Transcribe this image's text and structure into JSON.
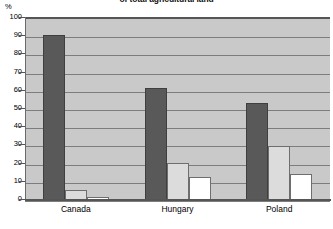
{
  "chart_data": {
    "type": "bar",
    "title": "of total agricultural land",
    "subtitle": "",
    "xlabel": "",
    "ylabel": "%",
    "ylim": [
      0,
      100
    ],
    "ytick_step": 10,
    "yticks": [
      100,
      90,
      80,
      70,
      60,
      50,
      40,
      30,
      20,
      10,
      0
    ],
    "grid": true,
    "legend": "none",
    "categories": [
      "Canada",
      "Hungary",
      "Poland"
    ],
    "series": [
      {
        "name": "series-1",
        "color": "#595959",
        "values": [
          91,
          62,
          54
        ]
      },
      {
        "name": "series-2",
        "color": "#dcdcdc",
        "values": [
          6,
          21,
          30
        ]
      },
      {
        "name": "series-3",
        "color": "#ffffff",
        "values": [
          2,
          13,
          15
        ]
      }
    ],
    "colors": {
      "plot_background": "#c9c9c9",
      "gridline": "#7d7d7d",
      "axis": "#555555",
      "page_background": "#ffffff"
    }
  }
}
